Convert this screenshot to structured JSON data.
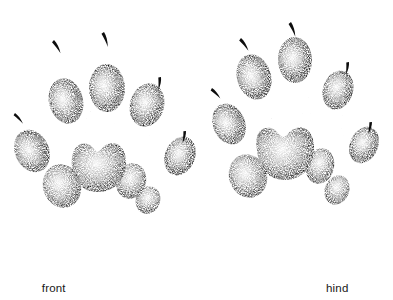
{
  "figure": {
    "title_faint": "",
    "background_color": "#ffffff",
    "ink_color": "#101010",
    "medium": "stipple / pen-and-ink illustration",
    "captions": [
      {
        "label": "front"
      },
      {
        "label": "hind"
      }
    ]
  },
  "tracks": [
    {
      "id": "front-track",
      "name": "front",
      "caption": "front",
      "center_x": 98,
      "toe_pad_count": 5,
      "claw_mark_count": 5,
      "palm_lobe_count": 4,
      "has_vestigial_pad": true,
      "toe_pads": [
        {
          "name": "toe-pad-outer-left",
          "cx": 32,
          "cy": 151,
          "rx": 17,
          "ry": 22,
          "rot": -24
        },
        {
          "name": "toe-pad-left",
          "cx": 66,
          "cy": 101,
          "rx": 17,
          "ry": 23,
          "rot": -14
        },
        {
          "name": "toe-pad-center",
          "cx": 107,
          "cy": 88,
          "rx": 18,
          "ry": 24,
          "rot": -2
        },
        {
          "name": "toe-pad-right",
          "cx": 147,
          "cy": 105,
          "rx": 17,
          "ry": 22,
          "rot": 16
        },
        {
          "name": "toe-pad-outer-right",
          "cx": 180,
          "cy": 156,
          "rx": 15,
          "ry": 20,
          "rot": 22
        }
      ],
      "claw_marks": [
        {
          "name": "claw-mark-outer-left",
          "x": 15,
          "y": 113,
          "rot": -26
        },
        {
          "name": "claw-mark-left",
          "x": 54,
          "y": 40,
          "rot": -16
        },
        {
          "name": "claw-mark-center",
          "x": 104,
          "y": 32,
          "rot": -4
        },
        {
          "name": "claw-mark-right",
          "x": 161,
          "y": 77,
          "rot": 22
        },
        {
          "name": "claw-mark-outer-right",
          "x": 186,
          "y": 131,
          "rot": 26
        }
      ],
      "vestigial_pad": {
        "name": "vestigial-pad",
        "cx": 85,
        "cy": 250,
        "r": 14
      }
    },
    {
      "id": "hind-track",
      "name": "hind",
      "caption": "hind",
      "center_x": 289,
      "toe_pad_count": 5,
      "claw_mark_count": 5,
      "palm_lobe_count": 4,
      "has_vestigial_pad": false,
      "toe_pads": [
        {
          "name": "toe-pad-outer-left",
          "cx": 229,
          "cy": 124,
          "rx": 16,
          "ry": 21,
          "rot": -22
        },
        {
          "name": "toe-pad-left",
          "cx": 254,
          "cy": 77,
          "rx": 17,
          "ry": 23,
          "rot": -16
        },
        {
          "name": "toe-pad-center",
          "cx": 295,
          "cy": 60,
          "rx": 17,
          "ry": 23,
          "rot": -2
        },
        {
          "name": "toe-pad-right",
          "cx": 338,
          "cy": 90,
          "rx": 15,
          "ry": 20,
          "rot": 18
        },
        {
          "name": "toe-pad-outer-right",
          "cx": 364,
          "cy": 145,
          "rx": 14,
          "ry": 19,
          "rot": 24
        }
      ],
      "claw_marks": [
        {
          "name": "claw-mark-outer-left",
          "x": 212,
          "y": 88,
          "rot": -28
        },
        {
          "name": "claw-mark-left",
          "x": 241,
          "y": 38,
          "rot": -20
        },
        {
          "name": "claw-mark-center",
          "x": 291,
          "y": 22,
          "rot": -6
        },
        {
          "name": "claw-mark-right",
          "x": 349,
          "y": 62,
          "rot": 24
        },
        {
          "name": "claw-mark-outer-right",
          "x": 372,
          "y": 122,
          "rot": 28
        }
      ]
    }
  ]
}
